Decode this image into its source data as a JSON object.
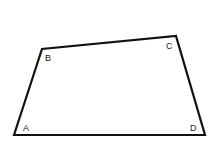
{
  "diagram": {
    "shape": "quadrilateral",
    "stroke_color": "#111111",
    "background": "#ffffff",
    "vertices": [
      {
        "name": "A",
        "x": 14,
        "y": 135,
        "label": "A",
        "label_x": 23,
        "label_y": 131
      },
      {
        "name": "B",
        "x": 42,
        "y": 49,
        "label": "B",
        "label_x": 45,
        "label_y": 61
      },
      {
        "name": "C",
        "x": 176,
        "y": 36,
        "label": "C",
        "label_x": 166,
        "label_y": 49
      },
      {
        "name": "D",
        "x": 205,
        "y": 135,
        "label": "D",
        "label_x": 190,
        "label_y": 131
      }
    ],
    "edges": [
      [
        "A",
        "B"
      ],
      [
        "B",
        "C"
      ],
      [
        "C",
        "D"
      ],
      [
        "D",
        "A"
      ]
    ]
  }
}
